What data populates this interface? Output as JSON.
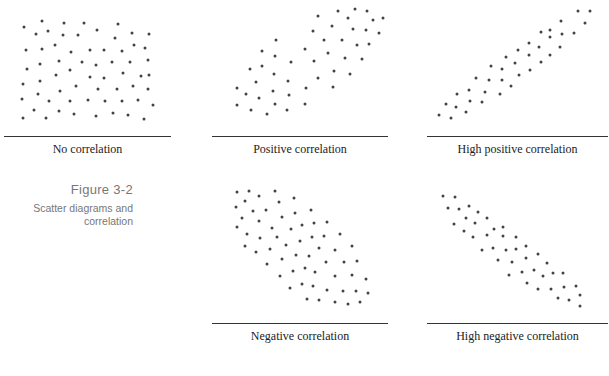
{
  "figure": {
    "title": "Figure 3-2",
    "caption_line1": "Scatter diagrams and",
    "caption_line2": "correlation",
    "dot_color": "#444444",
    "rule_color": "#333333"
  },
  "chart_data": [
    {
      "type": "scatter",
      "title": "No correlation",
      "points": [
        [
          42,
          21
        ],
        [
          24,
          27
        ],
        [
          64,
          23
        ],
        [
          84,
          23
        ],
        [
          118,
          24
        ],
        [
          36,
          34
        ],
        [
          48,
          31
        ],
        [
          63,
          35
        ],
        [
          78,
          35
        ],
        [
          97,
          30
        ],
        [
          115,
          38
        ],
        [
          132,
          33
        ],
        [
          149,
          34
        ],
        [
          26,
          50
        ],
        [
          42,
          49
        ],
        [
          55,
          45
        ],
        [
          71,
          52
        ],
        [
          90,
          50
        ],
        [
          104,
          50
        ],
        [
          122,
          51
        ],
        [
          134,
          45
        ],
        [
          145,
          48
        ],
        [
          40,
          64
        ],
        [
          59,
          61
        ],
        [
          82,
          62
        ],
        [
          96,
          65
        ],
        [
          112,
          62
        ],
        [
          130,
          62
        ],
        [
          148,
          60
        ],
        [
          27,
          69
        ],
        [
          70,
          70
        ],
        [
          56,
          75
        ],
        [
          90,
          77
        ],
        [
          104,
          78
        ],
        [
          123,
          73
        ],
        [
          141,
          76
        ],
        [
          149,
          75
        ],
        [
          23,
          84
        ],
        [
          40,
          81
        ],
        [
          76,
          86
        ],
        [
          60,
          91
        ],
        [
          98,
          89
        ],
        [
          117,
          89
        ],
        [
          133,
          86
        ],
        [
          148,
          89
        ],
        [
          38,
          94
        ],
        [
          22,
          99
        ],
        [
          49,
          101
        ],
        [
          70,
          101
        ],
        [
          88,
          100
        ],
        [
          105,
          101
        ],
        [
          122,
          101
        ],
        [
          138,
          100
        ],
        [
          153,
          105
        ],
        [
          34,
          110
        ],
        [
          59,
          111
        ],
        [
          74,
          114
        ],
        [
          113,
          113
        ],
        [
          128,
          115
        ],
        [
          23,
          118
        ],
        [
          46,
          118
        ],
        [
          96,
          116
        ],
        [
          144,
          119
        ]
      ],
      "rule": {
        "x1": 4,
        "x2": 171,
        "y": 136
      },
      "label_center_x": 88,
      "label_top": 142
    },
    {
      "type": "scatter",
      "title": "Positive correlation",
      "points": [
        [
          338,
          11
        ],
        [
          355,
          9
        ],
        [
          367,
          11
        ],
        [
          318,
          16
        ],
        [
          348,
          18
        ],
        [
          373,
          20
        ],
        [
          383,
          18
        ],
        [
          332,
          26
        ],
        [
          313,
          31
        ],
        [
          353,
          29
        ],
        [
          366,
          30
        ],
        [
          379,
          33
        ],
        [
          276,
          40
        ],
        [
          324,
          40
        ],
        [
          342,
          40
        ],
        [
          357,
          45
        ],
        [
          369,
          44
        ],
        [
          262,
          51
        ],
        [
          305,
          49
        ],
        [
          328,
          53
        ],
        [
          275,
          56
        ],
        [
          291,
          62
        ],
        [
          314,
          61
        ],
        [
          345,
          58
        ],
        [
          362,
          59
        ],
        [
          250,
          69
        ],
        [
          262,
          66
        ],
        [
          334,
          71
        ],
        [
          350,
          74
        ],
        [
          274,
          74
        ],
        [
          318,
          78
        ],
        [
          256,
          82
        ],
        [
          288,
          81
        ],
        [
          237,
          88
        ],
        [
          306,
          88
        ],
        [
          333,
          87
        ],
        [
          246,
          94
        ],
        [
          273,
          91
        ],
        [
          289,
          95
        ],
        [
          259,
          98
        ],
        [
          237,
          105
        ],
        [
          275,
          104
        ],
        [
          305,
          104
        ],
        [
          251,
          110
        ],
        [
          267,
          114
        ],
        [
          287,
          110
        ]
      ],
      "rule": {
        "x1": 212,
        "x2": 388,
        "y": 136
      },
      "label_center_x": 300,
      "label_top": 142
    },
    {
      "type": "scatter",
      "title": "High positive correlation",
      "points": [
        [
          578,
          11
        ],
        [
          590,
          11
        ],
        [
          561,
          21
        ],
        [
          585,
          23
        ],
        [
          541,
          32
        ],
        [
          550,
          30
        ],
        [
          550,
          37
        ],
        [
          562,
          34
        ],
        [
          574,
          33
        ],
        [
          529,
          43
        ],
        [
          539,
          47
        ],
        [
          560,
          47
        ],
        [
          518,
          50
        ],
        [
          529,
          55
        ],
        [
          550,
          55
        ],
        [
          506,
          57
        ],
        [
          515,
          63
        ],
        [
          541,
          62
        ],
        [
          491,
          66
        ],
        [
          502,
          69
        ],
        [
          530,
          70
        ],
        [
          519,
          75
        ],
        [
          476,
          78
        ],
        [
          489,
          80
        ],
        [
          502,
          80
        ],
        [
          511,
          86
        ],
        [
          469,
          90
        ],
        [
          457,
          94
        ],
        [
          485,
          92
        ],
        [
          500,
          94
        ],
        [
          446,
          104
        ],
        [
          470,
          101
        ],
        [
          482,
          102
        ],
        [
          456,
          107
        ],
        [
          466,
          112
        ],
        [
          439,
          115
        ],
        [
          451,
          118
        ]
      ],
      "rule": {
        "x1": 427,
        "x2": 608,
        "y": 136
      },
      "label_center_x": 517,
      "label_top": 142
    },
    {
      "type": "scatter",
      "title": "Negative correlation",
      "points": [
        [
          237,
          192
        ],
        [
          249,
          191
        ],
        [
          259,
          196
        ],
        [
          275,
          191
        ],
        [
          245,
          201
        ],
        [
          279,
          202
        ],
        [
          294,
          198
        ],
        [
          236,
          207
        ],
        [
          253,
          211
        ],
        [
          266,
          210
        ],
        [
          282,
          217
        ],
        [
          295,
          213
        ],
        [
          311,
          210
        ],
        [
          242,
          218
        ],
        [
          259,
          221
        ],
        [
          237,
          227
        ],
        [
          272,
          228
        ],
        [
          291,
          229
        ],
        [
          302,
          225
        ],
        [
          314,
          223
        ],
        [
          327,
          222
        ],
        [
          247,
          234
        ],
        [
          260,
          238
        ],
        [
          277,
          237
        ],
        [
          300,
          241
        ],
        [
          312,
          237
        ],
        [
          324,
          236
        ],
        [
          340,
          234
        ],
        [
          245,
          246
        ],
        [
          286,
          245
        ],
        [
          270,
          249
        ],
        [
          319,
          248
        ],
        [
          335,
          250
        ],
        [
          352,
          246
        ],
        [
          256,
          252
        ],
        [
          296,
          255
        ],
        [
          309,
          256
        ],
        [
          282,
          259
        ],
        [
          267,
          264
        ],
        [
          326,
          262
        ],
        [
          344,
          262
        ],
        [
          357,
          261
        ],
        [
          305,
          268
        ],
        [
          293,
          271
        ],
        [
          315,
          272
        ],
        [
          280,
          276
        ],
        [
          335,
          276
        ],
        [
          352,
          275
        ],
        [
          366,
          279
        ],
        [
          302,
          284
        ],
        [
          313,
          286
        ],
        [
          290,
          288
        ],
        [
          327,
          290
        ],
        [
          343,
          291
        ],
        [
          356,
          291
        ],
        [
          368,
          293
        ],
        [
          307,
          299
        ],
        [
          319,
          300
        ],
        [
          335,
          302
        ],
        [
          348,
          304
        ],
        [
          360,
          302
        ]
      ],
      "rule": {
        "x1": 212,
        "x2": 388,
        "y": 323
      },
      "label_center_x": 300,
      "label_top": 329
    },
    {
      "type": "scatter",
      "title": "High negative correlation",
      "points": [
        [
          443,
          196
        ],
        [
          455,
          197
        ],
        [
          448,
          208
        ],
        [
          459,
          209
        ],
        [
          469,
          206
        ],
        [
          478,
          212
        ],
        [
          466,
          218
        ],
        [
          475,
          223
        ],
        [
          487,
          218
        ],
        [
          454,
          224
        ],
        [
          464,
          231
        ],
        [
          494,
          229
        ],
        [
          503,
          227
        ],
        [
          473,
          237
        ],
        [
          487,
          235
        ],
        [
          503,
          236
        ],
        [
          516,
          237
        ],
        [
          482,
          250
        ],
        [
          493,
          248
        ],
        [
          506,
          250
        ],
        [
          516,
          249
        ],
        [
          526,
          246
        ],
        [
          538,
          254
        ],
        [
          498,
          260
        ],
        [
          512,
          262
        ],
        [
          526,
          258
        ],
        [
          547,
          263
        ],
        [
          522,
          272
        ],
        [
          534,
          270
        ],
        [
          509,
          275
        ],
        [
          543,
          276
        ],
        [
          553,
          273
        ],
        [
          563,
          273
        ],
        [
          527,
          283
        ],
        [
          538,
          289
        ],
        [
          551,
          289
        ],
        [
          564,
          287
        ],
        [
          576,
          286
        ],
        [
          580,
          295
        ],
        [
          558,
          298
        ],
        [
          569,
          300
        ],
        [
          580,
          306
        ]
      ],
      "rule": {
        "x1": 427,
        "x2": 608,
        "y": 323
      },
      "label_center_x": 517,
      "label_top": 329
    }
  ]
}
